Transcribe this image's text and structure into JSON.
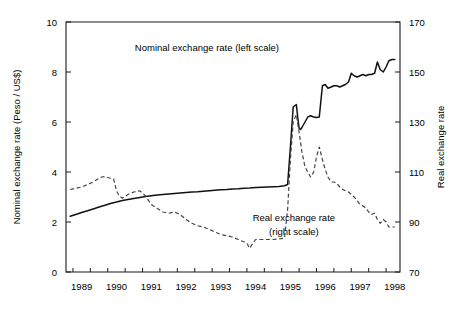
{
  "chart_data": {
    "type": "line",
    "title": "",
    "xlabel": "",
    "ylabel": "Nominal exchange rate (Peso / US$)",
    "y2label": "Real exchange rate",
    "xlim": [
      1988.3,
      1997.9
    ],
    "ylim": [
      0,
      10
    ],
    "y2lim": [
      70,
      170
    ],
    "grid": false,
    "legend_position": "inline-annotations",
    "xticks": [
      1988.5,
      1989,
      1989.5,
      1990,
      1990.5,
      1991,
      1991.5,
      1992,
      1992.5,
      1993,
      1993.5,
      1994,
      1994.5,
      1995,
      1995.5,
      1996,
      1996.5,
      1997,
      1997.5
    ],
    "xtick_labels": [
      "1989",
      "1990",
      "1991",
      "1992",
      "1993",
      "1994",
      "1995",
      "1996",
      "1997",
      "1998"
    ],
    "xtick_label_positions": [
      1988.75,
      1989.75,
      1990.75,
      1991.75,
      1992.75,
      1993.75,
      1994.75,
      1995.75,
      1996.75,
      1997.75
    ],
    "yticks": [
      0,
      2,
      4,
      6,
      8,
      10
    ],
    "ytick_labels": [
      "0",
      "2",
      "4",
      "6",
      "8",
      "10"
    ],
    "y2ticks": [
      70,
      90,
      110,
      130,
      150,
      170
    ],
    "y2tick_labels": [
      "70",
      "90",
      "110",
      "130",
      "150",
      "170"
    ],
    "annotations": [
      {
        "text": "Nominal exchange rate (left scale)",
        "x": 1992.35,
        "y": 8.85
      },
      {
        "text": "Real exchange rate",
        "x": 1994.85,
        "y": 2.05
      },
      {
        "text": "(right scale)",
        "x": 1994.85,
        "y": 1.5
      }
    ],
    "series": [
      {
        "name": "Nominal exchange rate (left scale)",
        "axis": "left",
        "style": "solid",
        "color": "#111111",
        "unit": "Peso / US$",
        "x": [
          1988.42,
          1988.58,
          1988.75,
          1988.92,
          1989.08,
          1989.25,
          1989.42,
          1989.58,
          1989.75,
          1989.92,
          1990.08,
          1990.25,
          1990.42,
          1990.58,
          1990.75,
          1990.92,
          1991.08,
          1991.25,
          1991.42,
          1991.58,
          1991.75,
          1991.92,
          1992.08,
          1992.25,
          1992.42,
          1992.58,
          1992.75,
          1992.92,
          1993.08,
          1993.25,
          1993.42,
          1993.58,
          1993.75,
          1993.92,
          1994.08,
          1994.25,
          1994.42,
          1994.58,
          1994.67,
          1994.75,
          1994.83,
          1994.92,
          1994.96,
          1995.0,
          1995.04,
          1995.08,
          1995.17,
          1995.25,
          1995.33,
          1995.42,
          1995.5,
          1995.58,
          1995.67,
          1995.75,
          1995.83,
          1995.92,
          1996.0,
          1996.08,
          1996.17,
          1996.25,
          1996.33,
          1996.42,
          1996.5,
          1996.58,
          1996.67,
          1996.75,
          1996.83,
          1996.92,
          1997.0,
          1997.08,
          1997.17,
          1997.25,
          1997.33,
          1997.42,
          1997.5,
          1997.58,
          1997.67,
          1997.75
        ],
        "values": [
          2.23,
          2.3,
          2.38,
          2.45,
          2.52,
          2.6,
          2.67,
          2.74,
          2.8,
          2.86,
          2.9,
          2.94,
          2.98,
          3.02,
          3.05,
          3.08,
          3.1,
          3.12,
          3.14,
          3.16,
          3.18,
          3.2,
          3.21,
          3.23,
          3.25,
          3.27,
          3.29,
          3.3,
          3.32,
          3.33,
          3.35,
          3.36,
          3.38,
          3.39,
          3.4,
          3.41,
          3.42,
          3.45,
          3.5,
          5.0,
          6.6,
          6.7,
          6.2,
          5.75,
          5.7,
          5.78,
          6.0,
          6.2,
          6.25,
          6.2,
          6.18,
          6.2,
          7.45,
          7.5,
          7.35,
          7.4,
          7.45,
          7.45,
          7.4,
          7.45,
          7.5,
          7.6,
          7.95,
          7.85,
          7.8,
          7.85,
          7.9,
          7.85,
          7.9,
          7.9,
          7.95,
          8.4,
          8.1,
          8.0,
          8.2,
          8.45,
          8.5,
          8.5
        ]
      },
      {
        "name": "Real exchange rate (right scale)",
        "axis": "right",
        "style": "dashed",
        "color": "#444444",
        "unit": "index",
        "x": [
          1988.42,
          1988.58,
          1988.75,
          1988.92,
          1989.08,
          1989.25,
          1989.33,
          1989.42,
          1989.5,
          1989.58,
          1989.67,
          1989.75,
          1989.83,
          1989.92,
          1990.08,
          1990.25,
          1990.42,
          1990.58,
          1990.75,
          1990.92,
          1991.08,
          1991.25,
          1991.42,
          1991.58,
          1991.75,
          1991.92,
          1992.08,
          1992.25,
          1992.42,
          1992.58,
          1992.75,
          1992.92,
          1993.08,
          1993.25,
          1993.42,
          1993.5,
          1993.58,
          1993.67,
          1993.75,
          1993.92,
          1994.08,
          1994.25,
          1994.42,
          1994.58,
          1994.67,
          1994.75,
          1994.83,
          1994.92,
          1995.0,
          1995.08,
          1995.17,
          1995.25,
          1995.33,
          1995.42,
          1995.5,
          1995.58,
          1995.67,
          1995.75,
          1995.83,
          1995.92,
          1996.0,
          1996.08,
          1996.17,
          1996.25,
          1996.33,
          1996.42,
          1996.5,
          1996.58,
          1996.67,
          1996.75,
          1996.83,
          1996.92,
          1997.0,
          1997.08,
          1997.17,
          1997.25,
          1997.33,
          1997.42,
          1997.5,
          1997.58,
          1997.67,
          1997.75
        ],
        "values": [
          103,
          103.5,
          104,
          105,
          106,
          107.5,
          108,
          108.2,
          107.8,
          107.5,
          107.2,
          102.5,
          100.5,
          99.5,
          101,
          102,
          102.5,
          100.5,
          97,
          95.5,
          94,
          93.5,
          94,
          93,
          91,
          89.5,
          88.5,
          88,
          87,
          86,
          85,
          84.5,
          84,
          83,
          82,
          81.5,
          79.5,
          81.5,
          83,
          83,
          83,
          83,
          83.2,
          83.5,
          95,
          115,
          130,
          133,
          126,
          118,
          112,
          110,
          108,
          110,
          116,
          120,
          115,
          111,
          108,
          106,
          106,
          105.5,
          104,
          103,
          102.5,
          102,
          101,
          100,
          98.5,
          97,
          96.5,
          95.5,
          94,
          93,
          93.5,
          91,
          89.5,
          91,
          90,
          88,
          88,
          88
        ]
      }
    ]
  }
}
